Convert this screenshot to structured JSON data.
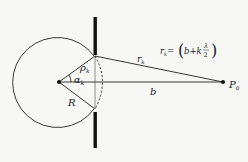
{
  "diagram": {
    "colors": {
      "line": "#222222",
      "background": "#f7f7f5"
    },
    "labels": {
      "rho": "ρ",
      "rho_sub": "k",
      "alpha": "α",
      "alpha_sub": "k",
      "R": "R",
      "r": "r",
      "r_sub": "k",
      "b": "b",
      "P": "P",
      "P_sub": "0",
      "formula_lhs": "r",
      "formula_lhs_sub": "k",
      "formula_eq": "=",
      "formula_open": "(",
      "formula_body": "b+k",
      "formula_num": "λ",
      "formula_den": "2",
      "formula_close": ")"
    }
  }
}
